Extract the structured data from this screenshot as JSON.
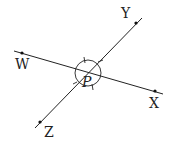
{
  "diagram": {
    "type": "intersecting-lines",
    "intersection_label": "P",
    "lines": [
      {
        "name": "line-WX",
        "from_label": "W",
        "to_label": "X"
      },
      {
        "name": "line-YZ",
        "from_label": "Y",
        "to_label": "Z"
      }
    ],
    "points": [
      {
        "label": "W"
      },
      {
        "label": "X"
      },
      {
        "label": "Y"
      },
      {
        "label": "Z"
      },
      {
        "label": "P"
      }
    ],
    "angle_marks": "circle around P with four tick marks",
    "colors": {
      "line": "#222222",
      "background": "#ffffff"
    }
  }
}
